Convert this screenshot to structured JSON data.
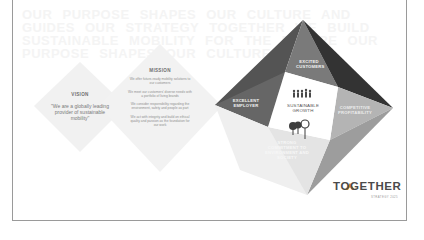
{
  "slide": {
    "background_text": "OUR PURPOSE SHAPES OUR CULTURE AND GUIDES OUR STRATEGY TOGETHER WE BUILD SUSTAINABLE MOBILITY FOR THE FUTURE OUR PURPOSE SHAPES OUR CULTURE",
    "vision": {
      "title": "VISION",
      "quote": "\"We are a globally leading provider of sustainable mobility\""
    },
    "mission": {
      "title": "MISSION",
      "lines": [
        "We offer future-ready mobility solutions to our customers",
        "We meet our customers' diverse needs with a portfolio of living brands",
        "We consider responsibility regarding the environment, safety and people as part",
        "We act with integrity and build on ethical quality and passion as the foundation for our work"
      ]
    },
    "pyramid": {
      "top_label": "EXCITED CUSTOMERS",
      "left_label": "EXCELLENT EMPLOYER",
      "right_label": "COMPETITIVE PROFITABILITY",
      "bottom_label": "STRONG COMMITMENT TO ENVIRONMENT AND SOCIETY",
      "center_label": "SUSTAINABLE GROWTH",
      "icons": [
        "people-icon",
        "trees-icon"
      ]
    },
    "logo": {
      "text": "TOGETHER",
      "subtitle": "STRATEGY 2025"
    },
    "colors": {
      "face_dark": "#3c3c3c",
      "face_mid": "#6b6b6b",
      "face_gray": "#8c8c8c",
      "face_light": "#c9c9c9",
      "face_lighter": "#e2e2e2",
      "diamond_fill": "#f0f0f0"
    }
  }
}
